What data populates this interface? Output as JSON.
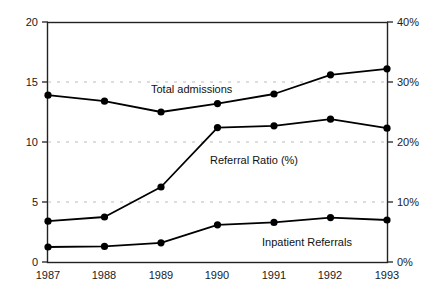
{
  "chart_data": {
    "type": "line",
    "title": "",
    "subtitle": "",
    "xlabel": "",
    "ylabel": "",
    "categories": [
      "1987",
      "1988",
      "1989",
      "1990",
      "1991",
      "1992",
      "1993"
    ],
    "x": [
      1987,
      1988,
      1989,
      1990,
      1991,
      1992,
      1993
    ],
    "grid": true,
    "grid_style": "dashed-horizontal-light-gray",
    "legend": "inline-annotations",
    "axes": {
      "left": {
        "ticks": [
          "0",
          "5",
          "10",
          "15",
          "20"
        ],
        "values": [
          0,
          5,
          10,
          15,
          20
        ],
        "ylim": [
          0,
          20
        ]
      },
      "right": {
        "ticks": [
          "0%",
          "10%",
          "20%",
          "30%",
          "40%"
        ],
        "values": [
          0,
          10,
          20,
          30,
          40
        ],
        "ylim": [
          0,
          40
        ]
      }
    },
    "series": [
      {
        "name": "Total admissions",
        "axis": "left",
        "marker": "filled-circle",
        "color": "#000000",
        "values": [
          13.9,
          13.4,
          12.5,
          13.2,
          14.0,
          15.6,
          16.1
        ]
      },
      {
        "name": "Referral Ratio (%)",
        "axis": "right",
        "marker": "filled-circle",
        "color": "#000000",
        "values": [
          6.8,
          7.5,
          12.5,
          22.4,
          22.7,
          23.8,
          22.3
        ],
        "values_left_scale": [
          3.4,
          3.75,
          6.25,
          11.2,
          11.35,
          11.9,
          11.15
        ]
      },
      {
        "name": "Inpatient Referrals",
        "axis": "left",
        "marker": "filled-circle",
        "color": "#000000",
        "values": [
          1.25,
          1.3,
          1.6,
          3.1,
          3.3,
          3.7,
          3.5
        ]
      }
    ],
    "annotations": [
      {
        "text": "Total admissions",
        "x_px": 151,
        "y_px": 84
      },
      {
        "text": "Referral Ratio (%)",
        "x_px": 210,
        "y_px": 155
      },
      {
        "text": "Inpatient Referrals",
        "x_px": 262,
        "y_px": 237
      }
    ]
  },
  "colors": {
    "line": "#111111",
    "marker": "#000000",
    "axis": "#222222",
    "grid": "#b9b9c4",
    "text": "#1a1a1a",
    "background": "#ffffff"
  }
}
